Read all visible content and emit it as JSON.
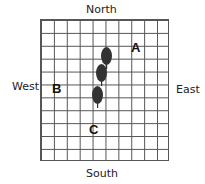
{
  "compass": {
    "north": "North",
    "south": "South",
    "west": "West",
    "east": "East"
  },
  "grid": {
    "columns": 10,
    "rows": 11
  },
  "points": [
    {
      "label": "A"
    },
    {
      "label": "B"
    },
    {
      "label": "C"
    }
  ],
  "trees": [
    {
      "name": "tree"
    },
    {
      "name": "tree"
    },
    {
      "name": "tree"
    }
  ]
}
